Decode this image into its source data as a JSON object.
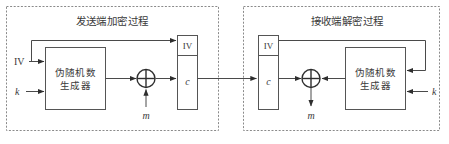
{
  "diagram": {
    "panels": [
      {
        "id": "sender",
        "title": "发送端加密过程",
        "prng_label_line1": "伪随机数",
        "prng_label_line2": "生成器",
        "iv_cell_label": "IV",
        "c_cell_label": "c",
        "inputs": [
          {
            "name": "iv-input",
            "label": "IV"
          },
          {
            "name": "key-input",
            "label": "k"
          },
          {
            "name": "plaintext-input",
            "label": "m"
          }
        ],
        "xor_symbol": "⊕"
      },
      {
        "id": "receiver",
        "title": "接收端解密过程",
        "prng_label_line1": "伪随机数",
        "prng_label_line2": "生成器",
        "iv_cell_label": "IV",
        "c_cell_label": "c",
        "inputs": [
          {
            "name": "key-input",
            "label": "k"
          }
        ],
        "outputs": [
          {
            "name": "plaintext-output",
            "label": "m"
          }
        ],
        "xor_symbol": "⊕"
      }
    ],
    "colors": {
      "frame_dashed": "#8a8a8a",
      "box_stroke": "#555555",
      "wire": "#4a4a4a",
      "text": "#3a3a3a",
      "background": "#ffffff"
    }
  }
}
